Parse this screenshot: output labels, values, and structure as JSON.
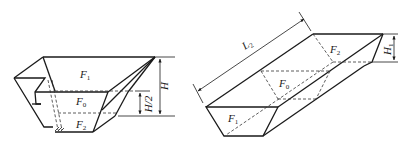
{
  "figure_left": {
    "title": "Hopper with stepped side",
    "labels": {
      "F1": {
        "base": "F",
        "sub": "1"
      },
      "F0": {
        "base": "F",
        "sub": "0"
      },
      "F2": {
        "base": "F",
        "sub": "2"
      }
    },
    "dimensions": {
      "height": "H",
      "half_height": "H/2"
    }
  },
  "figure_right": {
    "title": "Inclined trough",
    "labels": {
      "F1": {
        "base": "F",
        "sub": "1"
      },
      "F0": {
        "base": "F",
        "sub": "0"
      },
      "F2": {
        "base": "F",
        "sub": "2"
      }
    },
    "dimensions": {
      "length": {
        "base": "L",
        "sub": "2"
      },
      "height": {
        "base": "H",
        "sub": "1"
      }
    }
  }
}
